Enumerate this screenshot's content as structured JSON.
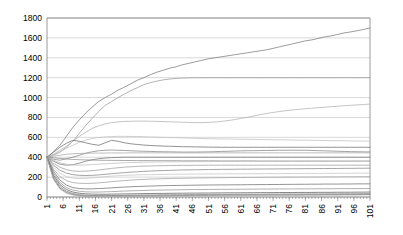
{
  "chart_data": {
    "type": "line",
    "title": "",
    "subtitle": "",
    "xlabel": "",
    "ylabel": "",
    "xlim": [
      1,
      101
    ],
    "ylim": [
      0,
      1800
    ],
    "ytick_step": 200,
    "xtick_step": 5,
    "grid": true,
    "legend": "none",
    "yticks": [
      0,
      200,
      400,
      600,
      800,
      1000,
      1200,
      1400,
      1600,
      1800
    ],
    "xticks": [
      1,
      6,
      11,
      16,
      21,
      26,
      31,
      36,
      41,
      46,
      51,
      56,
      61,
      66,
      71,
      76,
      81,
      86,
      91,
      96,
      101
    ],
    "x": [
      1,
      3,
      5,
      7,
      9,
      11,
      13,
      15,
      17,
      19,
      21,
      23,
      25,
      27,
      29,
      31,
      33,
      35,
      37,
      39,
      41,
      43,
      45,
      47,
      49,
      51,
      53,
      55,
      57,
      59,
      61,
      63,
      65,
      67,
      69,
      71,
      73,
      75,
      77,
      79,
      81,
      83,
      85,
      87,
      89,
      91,
      93,
      95,
      97,
      99,
      101
    ],
    "series": [
      {
        "name": "series-1",
        "color": "#7b7b7b",
        "values": [
          400,
          455,
          520,
          610,
          700,
          775,
          845,
          905,
          960,
          1000,
          1035,
          1075,
          1105,
          1140,
          1175,
          1200,
          1230,
          1255,
          1275,
          1295,
          1310,
          1330,
          1345,
          1360,
          1375,
          1390,
          1400,
          1410,
          1420,
          1430,
          1440,
          1450,
          1460,
          1470,
          1480,
          1495,
          1510,
          1525,
          1540,
          1555,
          1570,
          1580,
          1595,
          1610,
          1620,
          1635,
          1650,
          1660,
          1672,
          1685,
          1700
        ]
      },
      {
        "name": "series-2",
        "color": "#9a9a9a",
        "values": [
          400,
          420,
          450,
          500,
          560,
          640,
          720,
          790,
          860,
          920,
          960,
          1000,
          1035,
          1070,
          1100,
          1130,
          1150,
          1165,
          1178,
          1186,
          1192,
          1196,
          1198,
          1200,
          1200,
          1200,
          1200,
          1200,
          1200,
          1200,
          1200,
          1200,
          1200,
          1200,
          1200,
          1200,
          1200,
          1200,
          1200,
          1200,
          1200,
          1200,
          1200,
          1200,
          1200,
          1200,
          1200,
          1200,
          1200,
          1200,
          1200
        ]
      },
      {
        "name": "series-3",
        "color": "#b0b0b0",
        "values": [
          400,
          430,
          470,
          510,
          560,
          610,
          650,
          690,
          715,
          735,
          748,
          755,
          760,
          762,
          763,
          763,
          762,
          760,
          758,
          756,
          754,
          752,
          750,
          748,
          748,
          750,
          754,
          760,
          768,
          778,
          790,
          802,
          815,
          828,
          840,
          850,
          860,
          868,
          875,
          882,
          888,
          893,
          898,
          903,
          908,
          913,
          918,
          922,
          926,
          930,
          935
        ]
      },
      {
        "name": "series-4",
        "color": "#c0c0c0",
        "values": [
          400,
          425,
          455,
          490,
          520,
          550,
          572,
          588,
          598,
          604,
          608,
          610,
          610,
          609,
          608,
          606,
          604,
          602,
          600,
          598,
          596,
          594,
          592,
          590,
          588,
          586,
          585,
          584,
          583,
          582,
          581,
          580,
          579,
          578,
          577,
          576,
          575,
          574,
          573,
          572,
          571,
          570,
          569,
          568,
          567,
          566,
          565,
          564,
          563,
          562,
          561
        ]
      },
      {
        "name": "series-5",
        "color": "#6e6e6e",
        "values": [
          400,
          450,
          500,
          540,
          570,
          560,
          545,
          530,
          520,
          545,
          570,
          560,
          545,
          535,
          528,
          522,
          518,
          515,
          512,
          510,
          508,
          506,
          505,
          504,
          503,
          502,
          501,
          500,
          500,
          500,
          500,
          500,
          500,
          500,
          500,
          500,
          500,
          500,
          500,
          500,
          500,
          500,
          500,
          500,
          500,
          500,
          500,
          500,
          500,
          500,
          500
        ]
      },
      {
        "name": "series-6",
        "color": "#848484",
        "values": [
          400,
          380,
          370,
          385,
          400,
          420,
          440,
          455,
          465,
          470,
          472,
          470,
          468,
          465,
          462,
          460,
          458,
          456,
          455,
          454,
          453,
          452,
          452,
          452,
          453,
          454,
          456,
          458,
          460,
          462,
          464,
          465,
          466,
          467,
          468,
          469,
          470,
          470,
          470,
          470,
          470,
          468,
          466,
          464,
          462,
          460,
          458,
          456,
          455,
          454,
          453
        ]
      },
      {
        "name": "series-7",
        "color": "#a8a8a8",
        "values": [
          400,
          410,
          420,
          430,
          435,
          438,
          440,
          441,
          442,
          442,
          443,
          443,
          443,
          444,
          444,
          444,
          444,
          444,
          444,
          444,
          444,
          444,
          444,
          444,
          444,
          444,
          444,
          444,
          444,
          444,
          444,
          444,
          444,
          444,
          444,
          444,
          444,
          444,
          444,
          444,
          444,
          444,
          444,
          444,
          444,
          444,
          444,
          444,
          444,
          444,
          444
        ]
      },
      {
        "name": "series-8",
        "color": "#767676",
        "values": [
          400,
          360,
          330,
          320,
          325,
          340,
          360,
          375,
          385,
          392,
          396,
          398,
          400,
          400,
          400,
          400,
          400,
          400,
          400,
          400,
          400,
          400,
          400,
          400,
          400,
          400,
          400,
          400,
          400,
          400,
          400,
          400,
          400,
          400,
          400,
          400,
          400,
          400,
          400,
          400,
          400,
          400,
          400,
          400,
          400,
          400,
          400,
          400,
          400,
          400,
          400
        ]
      },
      {
        "name": "series-9",
        "color": "#8e8e8e",
        "values": [
          400,
          395,
          388,
          382,
          378,
          375,
          373,
          371,
          370,
          369,
          368,
          368,
          367,
          367,
          366,
          366,
          366,
          365,
          365,
          365,
          365,
          364,
          364,
          364,
          364,
          364,
          364,
          363,
          363,
          363,
          363,
          363,
          363,
          362,
          362,
          362,
          362,
          362,
          362,
          362,
          362,
          362,
          362,
          362,
          362,
          362,
          362,
          362,
          362,
          362,
          362
        ]
      },
      {
        "name": "series-10",
        "color": "#bdbdbd",
        "values": [
          400,
          370,
          345,
          330,
          322,
          320,
          322,
          326,
          330,
          334,
          338,
          341,
          344,
          346,
          348,
          350,
          351,
          352,
          353,
          354,
          354,
          355,
          355,
          356,
          356,
          356,
          357,
          357,
          357,
          357,
          358,
          358,
          358,
          358,
          358,
          358,
          358,
          358,
          358,
          358,
          358,
          358,
          358,
          358,
          358,
          358,
          358,
          358,
          358,
          358,
          358
        ]
      },
      {
        "name": "series-11",
        "color": "#9e9e9e",
        "values": [
          400,
          340,
          300,
          275,
          262,
          258,
          260,
          265,
          272,
          280,
          288,
          294,
          300,
          304,
          308,
          310,
          312,
          314,
          315,
          316,
          317,
          318,
          318,
          319,
          319,
          320,
          320,
          320,
          320,
          320,
          320,
          320,
          320,
          320,
          320,
          320,
          320,
          320,
          320,
          320,
          320,
          320,
          320,
          320,
          320,
          320,
          320,
          320,
          320,
          320,
          320
        ]
      },
      {
        "name": "series-12",
        "color": "#878787",
        "values": [
          400,
          320,
          270,
          240,
          225,
          218,
          216,
          218,
          222,
          228,
          234,
          240,
          245,
          250,
          254,
          258,
          261,
          264,
          266,
          268,
          270,
          272,
          273,
          274,
          275,
          276,
          277,
          278,
          278,
          279,
          280,
          280,
          281,
          281,
          282,
          282,
          283,
          283,
          284,
          284,
          285,
          285,
          286,
          286,
          287,
          287,
          288,
          288,
          289,
          289,
          290
        ]
      },
      {
        "name": "series-13",
        "color": "#c4c4c4",
        "values": [
          400,
          300,
          240,
          205,
          190,
          186,
          188,
          192,
          198,
          204,
          210,
          214,
          218,
          220,
          222,
          224,
          225,
          226,
          227,
          228,
          229,
          230,
          230,
          231,
          231,
          232,
          232,
          232,
          233,
          233,
          233,
          234,
          234,
          234,
          235,
          235,
          235,
          236,
          236,
          236,
          237,
          237,
          237,
          238,
          238,
          238,
          239,
          239,
          240,
          240,
          240
        ]
      },
      {
        "name": "series-14",
        "color": "#a0a0a0",
        "values": [
          400,
          280,
          205,
          165,
          145,
          138,
          136,
          138,
          142,
          148,
          154,
          160,
          165,
          170,
          174,
          177,
          180,
          182,
          184,
          186,
          188,
          189,
          190,
          191,
          192,
          193,
          194,
          194,
          195,
          196,
          196,
          197,
          197,
          198,
          198,
          199,
          199,
          200,
          200,
          200,
          201,
          201,
          201,
          202,
          202,
          202,
          203,
          203,
          203,
          204,
          204
        ]
      },
      {
        "name": "series-15",
        "color": "#707070",
        "values": [
          400,
          260,
          170,
          120,
          95,
          85,
          82,
          82,
          85,
          88,
          92,
          96,
          100,
          103,
          106,
          108,
          110,
          112,
          114,
          115,
          116,
          117,
          118,
          119,
          120,
          121,
          121,
          122,
          122,
          123,
          123,
          124,
          124,
          125,
          125,
          126,
          126,
          127,
          127,
          128,
          128,
          129,
          129,
          130,
          130,
          130,
          131,
          131,
          132,
          132,
          132
        ]
      },
      {
        "name": "series-16",
        "color": "#969696",
        "values": [
          400,
          240,
          145,
          95,
          70,
          58,
          52,
          50,
          50,
          52,
          54,
          57,
          60,
          62,
          64,
          66,
          68,
          69,
          70,
          71,
          72,
          73,
          74,
          75,
          75,
          76,
          76,
          77,
          77,
          78,
          78,
          79,
          79,
          80,
          80,
          80,
          81,
          81,
          81,
          82,
          82,
          82,
          83,
          83,
          83,
          84,
          84,
          84,
          85,
          85,
          85
        ]
      },
      {
        "name": "series-17",
        "color": "#5e5e5e",
        "values": [
          400,
          220,
          125,
          75,
          50,
          38,
          32,
          29,
          28,
          28,
          29,
          30,
          31,
          32,
          33,
          34,
          35,
          36,
          36,
          37,
          38,
          38,
          39,
          39,
          40,
          40,
          41,
          41,
          42,
          42,
          42,
          43,
          43,
          44,
          44,
          44,
          45,
          45,
          45,
          46,
          46,
          46,
          47,
          47,
          47,
          48,
          48,
          48,
          49,
          49,
          50
        ]
      },
      {
        "name": "series-18",
        "color": "#808080",
        "values": [
          400,
          200,
          105,
          58,
          35,
          24,
          18,
          15,
          14,
          14,
          15,
          16,
          17,
          18,
          19,
          20,
          20,
          21,
          22,
          22,
          23,
          23,
          24,
          24,
          25,
          25,
          26,
          26,
          26,
          27,
          27,
          28,
          28,
          28,
          29,
          29,
          29,
          30,
          30,
          30,
          31,
          31,
          31,
          32,
          32,
          32,
          33,
          33,
          33,
          34,
          34
        ]
      },
      {
        "name": "series-19",
        "color": "#666666",
        "values": [
          400,
          185,
          90,
          45,
          25,
          16,
          11,
          9,
          8,
          8,
          9,
          9,
          10,
          11,
          11,
          12,
          12,
          13,
          13,
          14,
          14,
          15,
          15,
          16,
          16,
          16,
          17,
          17,
          18,
          18,
          18,
          19,
          19,
          19,
          20,
          20,
          20,
          21,
          21,
          21,
          22,
          22,
          22,
          23,
          23,
          23,
          24,
          24,
          24,
          25,
          25
        ]
      },
      {
        "name": "series-20",
        "color": "#b5b5b5",
        "values": [
          400,
          175,
          80,
          38,
          20,
          12,
          8,
          6,
          5,
          5,
          5,
          6,
          6,
          7,
          7,
          8,
          8,
          9,
          9,
          10,
          10,
          11,
          11,
          12,
          12,
          12,
          13,
          13,
          14,
          14,
          14,
          15,
          15,
          15,
          16,
          16,
          16,
          17,
          17,
          17,
          18,
          18,
          18,
          19,
          19,
          19,
          20,
          20,
          20,
          21,
          21
        ]
      }
    ]
  }
}
